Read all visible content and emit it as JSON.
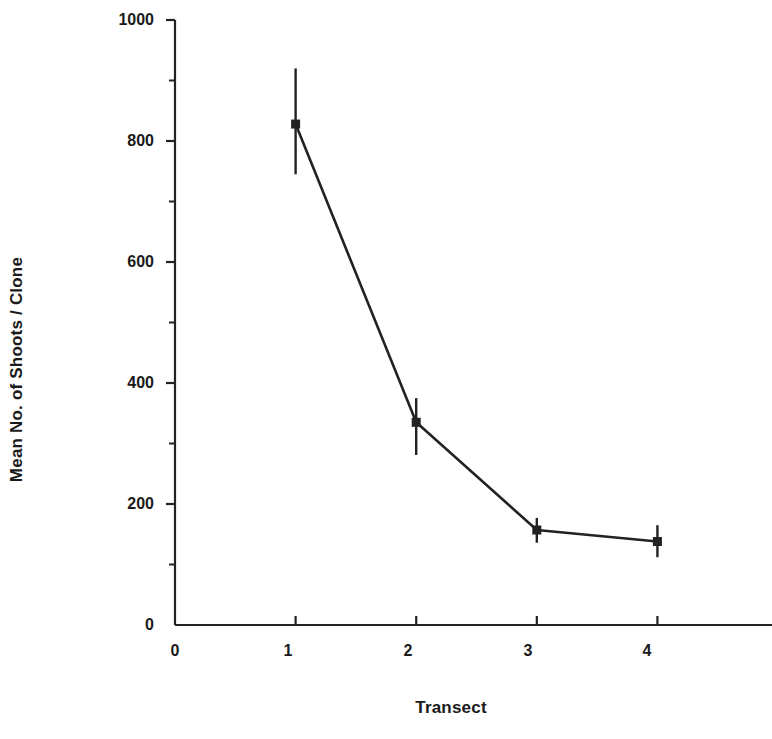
{
  "chart_data": {
    "type": "line",
    "title": "",
    "subtitle": "",
    "xlabel": "Transect",
    "ylabel": "Mean No. of Shoots / Clone",
    "x": [
      1,
      2,
      3,
      4
    ],
    "values": [
      828,
      335,
      157,
      138
    ],
    "error_upper": [
      920,
      375,
      177,
      165
    ],
    "error_lower": [
      745,
      281,
      136,
      112
    ],
    "errorbars": true,
    "marker": "filled-square",
    "series": [
      {
        "name": "Mean No. of Shoots / Clone",
        "x": [
          1,
          2,
          3,
          4
        ],
        "values": [
          828,
          335,
          157,
          138
        ],
        "error_upper": [
          920,
          375,
          177,
          165
        ],
        "error_lower": [
          745,
          281,
          136,
          112
        ]
      }
    ],
    "xlim": [
      0,
      4.95
    ],
    "ylim": [
      0,
      1000
    ],
    "xticks": [
      0,
      1,
      2,
      3,
      4
    ],
    "xtick_labels": [
      "0",
      "1",
      "2",
      "3",
      "4"
    ],
    "yticks": [
      0,
      200,
      400,
      600,
      800,
      1000
    ],
    "ytick_labels": [
      "0",
      "200",
      "400",
      "600",
      "800",
      "1000"
    ],
    "y_minor_ticks": [
      100,
      300,
      500,
      700,
      900
    ],
    "grid": false,
    "legend": "none",
    "line_color": "#222222",
    "marker_color": "#222222"
  },
  "axes": {
    "y_title": "Mean No. of Shoots / Clone",
    "x_title": "Transect"
  },
  "ytick_labels": {
    "t0": "0",
    "t200": "200",
    "t400": "400",
    "t600": "600",
    "t800": "800",
    "t1000": "1000"
  },
  "xtick_labels": {
    "t0": "0",
    "t1": "1",
    "t2": "2",
    "t3": "3",
    "t4": "4"
  }
}
